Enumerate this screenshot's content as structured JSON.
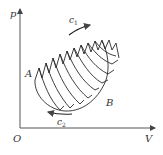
{
  "diagram": {
    "type": "p-V cycle diagram",
    "axes": {
      "y_label": "p",
      "x_label": "V",
      "origin_label": "O"
    },
    "points": {
      "A": "A",
      "B": "B"
    },
    "curves": {
      "upper": "c",
      "upper_sub": "1",
      "lower": "c",
      "lower_sub": "2"
    },
    "colors": {
      "line": "#2a2a2a",
      "axis": "#555555",
      "background": "#ffffff"
    }
  }
}
